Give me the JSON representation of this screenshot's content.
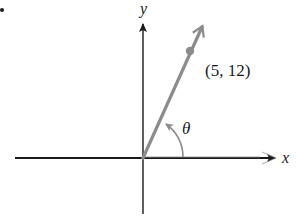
{
  "diagram": {
    "type": "coordinate-plane-angle",
    "axes": {
      "x_label": "x",
      "y_label": "y"
    },
    "ray": {
      "from": "origin",
      "through_point_label": "(5, 12)",
      "point": [
        5,
        12
      ]
    },
    "angle": {
      "label": "θ",
      "from": "positive x-axis",
      "to": "ray"
    },
    "colors": {
      "axes": "#1a1a1a",
      "ray": "#8c8c8c",
      "arc": "#8c8c8c",
      "background": "#ffffff"
    }
  }
}
